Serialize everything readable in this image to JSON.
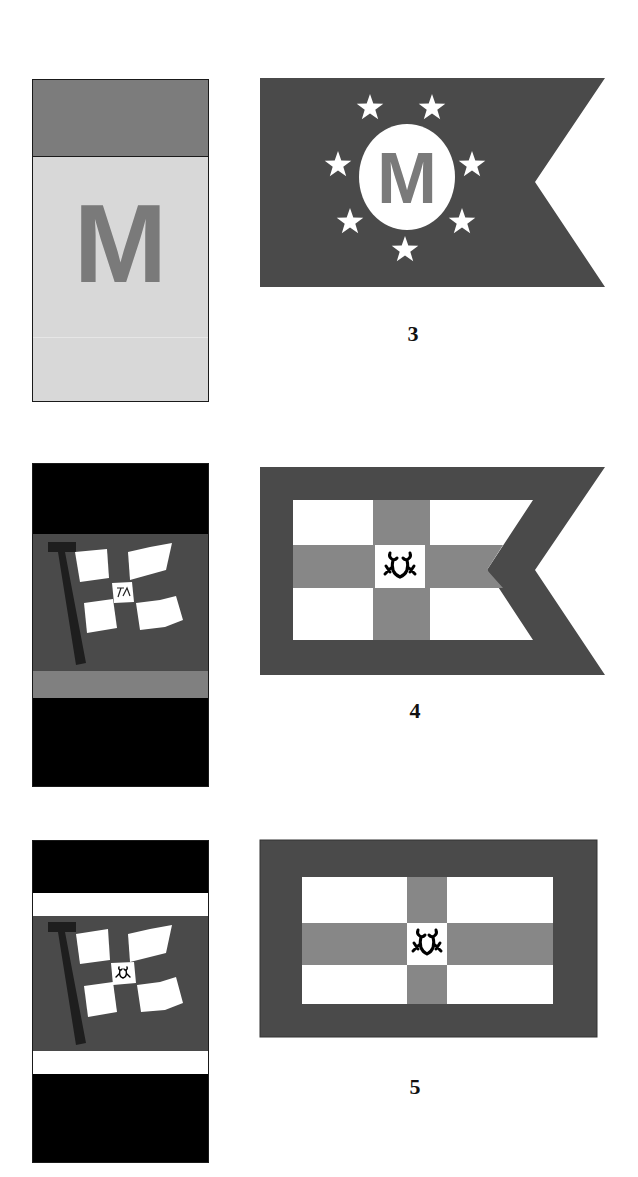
{
  "rows": [
    {
      "number": "3",
      "funnel": {
        "bands": [
          {
            "color": "#7c7c7c",
            "height": 77
          },
          {
            "color": "#d8d8d8",
            "height": 246
          }
        ],
        "emblem_letter": "M",
        "emblem_color": "#7a7a7a"
      },
      "flag": {
        "shape": "swallowtail",
        "field_color": "#4a4a4a",
        "disc_color": "#ffffff",
        "letter": "M",
        "letter_color": "#7a7a7a",
        "star_count": 7,
        "star_color": "#ffffff"
      }
    },
    {
      "number": "4",
      "funnel": {
        "bands": [
          {
            "color": "#000000",
            "height": 70
          },
          {
            "color": "#4a4a4a",
            "height": 137
          },
          {
            "color": "#808080",
            "height": 27
          },
          {
            "color": "#000000",
            "height": 90
          }
        ],
        "emblem": "waving-flag-with-pole",
        "emblem_mark": "monogram"
      },
      "flag": {
        "shape": "swallowtail",
        "border_color": "#4a4a4a",
        "field_color": "#ffffff",
        "cross_color": "#878787",
        "center_emblem": "frog"
      }
    },
    {
      "number": "5",
      "funnel": {
        "bands": [
          {
            "color": "#000000",
            "height": 52
          },
          {
            "color": "#ffffff",
            "height": 23
          },
          {
            "color": "#4a4a4a",
            "height": 135
          },
          {
            "color": "#ffffff",
            "height": 23
          },
          {
            "color": "#000000",
            "height": 90
          }
        ],
        "emblem": "waving-flag-with-pole",
        "emblem_mark": "frog"
      },
      "flag": {
        "shape": "rectangle",
        "border_color": "#4a4a4a",
        "field_color": "#ffffff",
        "cross_color": "#878787",
        "center_emblem": "frog"
      }
    }
  ]
}
